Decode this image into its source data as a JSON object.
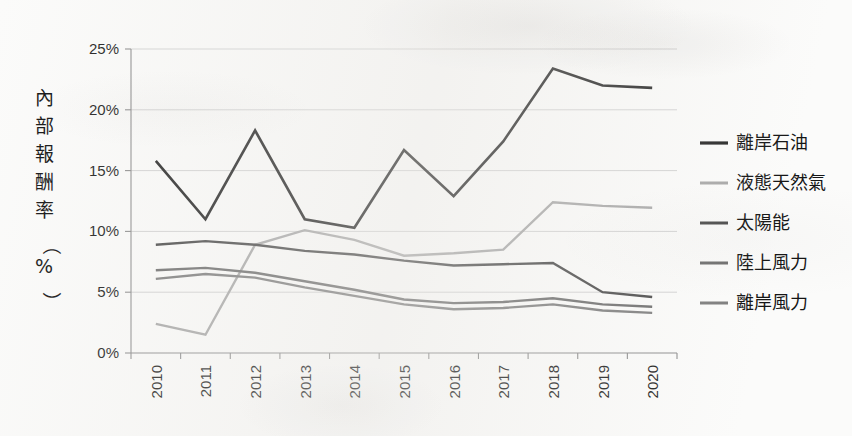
{
  "chart_data": {
    "type": "line",
    "title": "",
    "subtitle": "",
    "xlabel": "",
    "ylabel": "內部報酬率（%）",
    "ylabel_chars": [
      "內",
      "部",
      "報",
      "酬",
      "率",
      "（",
      "%",
      "）"
    ],
    "categories": [
      "2010",
      "2011",
      "2012",
      "2013",
      "2014",
      "2015",
      "2016",
      "2017",
      "2018",
      "2019",
      "2020"
    ],
    "x": [
      2010,
      2011,
      2012,
      2013,
      2014,
      2015,
      2016,
      2017,
      2018,
      2019,
      2020
    ],
    "ylim": [
      0,
      25
    ],
    "ytick_values": [
      0,
      5,
      10,
      15,
      20,
      25
    ],
    "ytick_labels": [
      "0%",
      "5%",
      "10%",
      "15%",
      "20%",
      "25%"
    ],
    "grid": true,
    "grid_axis": "y",
    "legend_position": "right",
    "value_unit": "%",
    "series": [
      {
        "name": "離岸石油",
        "color": "#262626",
        "width": 2.6,
        "values": [
          15.8,
          11.0,
          18.3,
          11.0,
          10.3,
          16.7,
          12.9,
          17.4,
          23.4,
          22.0,
          21.8
        ]
      },
      {
        "name": "液態天然氣",
        "color": "#a8a8a8",
        "width": 2.4,
        "values": [
          2.4,
          1.5,
          8.9,
          10.1,
          9.3,
          8.0,
          8.2,
          8.5,
          12.4,
          12.1,
          11.95
        ]
      },
      {
        "name": "太陽能",
        "color": "#4a4a4a",
        "width": 2.4,
        "values": [
          8.9,
          9.2,
          8.9,
          8.4,
          8.1,
          7.6,
          7.2,
          7.3,
          7.4,
          5.0,
          4.6
        ]
      },
      {
        "name": "陸上風力",
        "color": "#6d6d6d",
        "width": 2.4,
        "values": [
          6.8,
          7.0,
          6.6,
          5.9,
          5.2,
          4.4,
          4.1,
          4.2,
          4.5,
          4.0,
          3.8
        ]
      },
      {
        "name": "離岸風力",
        "color": "#7d7d7d",
        "width": 2.4,
        "values": [
          6.1,
          6.5,
          6.2,
          5.4,
          4.7,
          4.0,
          3.6,
          3.7,
          4.0,
          3.5,
          3.3
        ]
      }
    ]
  },
  "legend": {
    "entries": [
      "離岸石油",
      "液態天然氣",
      "太陽能",
      "陸上風力",
      "離岸風力"
    ]
  },
  "axes": {
    "y_title": "內部報酬率（%）"
  }
}
